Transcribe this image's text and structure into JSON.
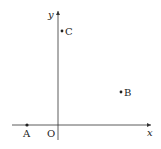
{
  "diagram": {
    "type": "coordinate-plane",
    "axes": {
      "x_label": "x",
      "y_label": "y",
      "origin_label": "O"
    },
    "points": [
      {
        "name": "A",
        "label": "A",
        "px": 27,
        "py": 125
      },
      {
        "name": "B",
        "label": "B",
        "px": 121,
        "py": 92
      },
      {
        "name": "C",
        "label": "C",
        "px": 62,
        "py": 31
      }
    ],
    "colors": {
      "stroke": "#333333",
      "text": "#222222"
    }
  }
}
